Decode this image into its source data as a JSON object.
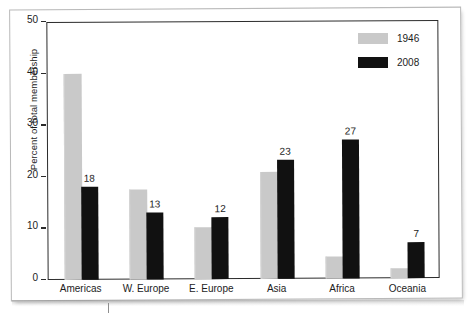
{
  "chart_data": {
    "type": "bar",
    "title": "",
    "subtitle": "",
    "xlabel": "",
    "ylabel": "Percent of total membership",
    "ylim": [
      0,
      50
    ],
    "yticks": [
      0,
      10,
      20,
      30,
      40,
      50
    ],
    "ytick_labels": [
      "0",
      "10",
      "20",
      "30",
      "40",
      "50"
    ],
    "grid": false,
    "legend_position": "top-right",
    "categories": [
      "Americas",
      "W. Europe",
      "E. Europe",
      "Asia",
      "Africa",
      "Oceania"
    ],
    "series": [
      {
        "name": "1946",
        "color": "#c9c9c9",
        "values": [
          40,
          17.5,
          10,
          20.8,
          4.2,
          2
        ],
        "labels": [
          "",
          "",
          "",
          "",
          "",
          ""
        ]
      },
      {
        "name": "2008",
        "color": "#111111",
        "values": [
          18,
          13,
          12,
          23,
          27,
          7
        ],
        "labels": [
          "18",
          "13",
          "12",
          "23",
          "27",
          "7"
        ]
      }
    ]
  },
  "legend": {
    "items": [
      {
        "label": "1946",
        "swatch": "light-gray"
      },
      {
        "label": "2008",
        "swatch": "black"
      }
    ]
  },
  "axes": {
    "y_axis_title": "Percent of total membership",
    "y_tick_labels": [
      "50",
      "40",
      "30",
      "20",
      "10",
      "0"
    ],
    "x_tick_labels": [
      "Americas",
      "W. Europe",
      "E. Europe",
      "Asia",
      "Africa",
      "Oceania"
    ]
  },
  "colors": {
    "series_1946": "#c9c9c9",
    "series_2008": "#111111",
    "axis": "#2b2b2b",
    "text": "#1c1c1c",
    "page_border": "#b9b9b9",
    "background": "#ffffff"
  }
}
